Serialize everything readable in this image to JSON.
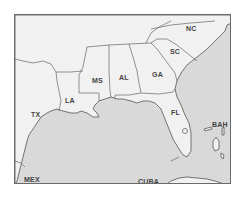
{
  "map": {
    "region": "Southeastern United States and Gulf of Mexico",
    "colors": {
      "land": "#f1f1f1",
      "water": "#d9d9d9",
      "border": "#555555",
      "label": "#444444"
    },
    "labels": {
      "nc": "NC",
      "sc": "SC",
      "ga": "GA",
      "al": "AL",
      "ms": "MS",
      "la": "LA",
      "tx": "TX",
      "fl": "FL",
      "bah": "BAH",
      "mex": "MEX",
      "cuba": "CUBA"
    }
  }
}
